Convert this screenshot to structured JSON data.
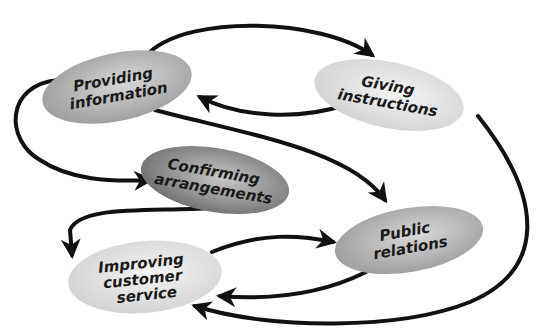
{
  "diagram": {
    "nodes": [
      {
        "id": "providing",
        "lines": [
          "Providing",
          "information"
        ],
        "shade": "medium"
      },
      {
        "id": "giving",
        "lines": [
          "Giving",
          "instructions"
        ],
        "shade": "light"
      },
      {
        "id": "confirming",
        "lines": [
          "Confirming",
          "arrangements"
        ],
        "shade": "dark"
      },
      {
        "id": "public",
        "lines": [
          "Public",
          "relations"
        ],
        "shade": "medium"
      },
      {
        "id": "improving",
        "lines": [
          "Improving",
          "customer",
          "service"
        ],
        "shade": "light"
      }
    ],
    "edges": [
      {
        "from": "providing",
        "to": "giving"
      },
      {
        "from": "giving",
        "to": "providing"
      },
      {
        "from": "providing",
        "to": "confirming"
      },
      {
        "from": "providing",
        "to": "public"
      },
      {
        "from": "confirming",
        "to": "improving"
      },
      {
        "from": "improving",
        "to": "public"
      },
      {
        "from": "public",
        "to": "improving"
      },
      {
        "from": "giving",
        "to": "improving"
      }
    ],
    "colors": {
      "light": "#e4e4e4",
      "medium": "#b8b8b8",
      "dark": "#8a8a8a",
      "arrow": "#111111"
    }
  }
}
